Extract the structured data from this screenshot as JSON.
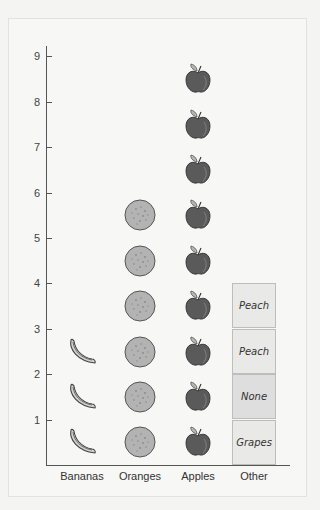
{
  "chart_data": {
    "type": "pictograph",
    "title": "",
    "xlabel": "",
    "ylabel": "",
    "ylim": [
      0,
      9
    ],
    "yticks": [
      1,
      2,
      3,
      4,
      5,
      6,
      7,
      8,
      9
    ],
    "categories": [
      "Bananas",
      "Oranges",
      "Apples",
      "Other"
    ],
    "values": [
      3,
      6,
      9,
      4
    ],
    "icons": [
      "banana-icon",
      "orange-icon",
      "apple-icon",
      "text-box"
    ],
    "other_breakdown": [
      "Grapes",
      "None",
      "Peach",
      "Peach"
    ],
    "grid": false,
    "legend": "none"
  },
  "axis": {
    "y_ticks": [
      "1",
      "2",
      "3",
      "4",
      "5",
      "6",
      "7",
      "8",
      "9"
    ],
    "x_labels": [
      "Bananas",
      "Oranges",
      "Apples",
      "Other"
    ]
  },
  "colors": {
    "banana_fill": "#c8c8c8",
    "orange_fill": "#b0b0b0",
    "apple_fill": "#595959",
    "axis": "#555555"
  }
}
